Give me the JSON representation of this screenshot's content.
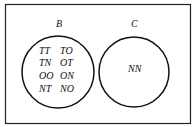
{
  "diagram": {
    "type": "venn",
    "sets": [
      {
        "label": "B",
        "elements": [
          "TT",
          "TO",
          "TN",
          "OT",
          "OO",
          "ON",
          "NT",
          "NO"
        ]
      },
      {
        "label": "C",
        "elements": [
          "NN"
        ]
      }
    ],
    "rows_b": [
      [
        "TT",
        "TO"
      ],
      [
        "TN",
        "OT"
      ],
      [
        "OO",
        "ON"
      ],
      [
        "NT",
        "NO"
      ]
    ],
    "c_content": "NN"
  }
}
